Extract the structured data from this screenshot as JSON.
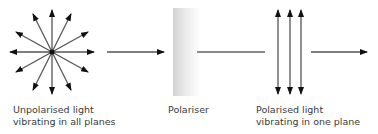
{
  "labels": {
    "unpolarised_line1": "Unpolarised light",
    "unpolarised_line2": "vibrating in all planes",
    "polariser": "Polariser",
    "polarised_line1": "Polarised light",
    "polarised_line2": "vibrating in one plane"
  },
  "colors": {
    "arrow": "#555555",
    "arrowhead": "#111111",
    "polariser_light": "#f7f7f7",
    "polariser_dark": "#cfcfcf",
    "text": "#3a3a3a"
  }
}
